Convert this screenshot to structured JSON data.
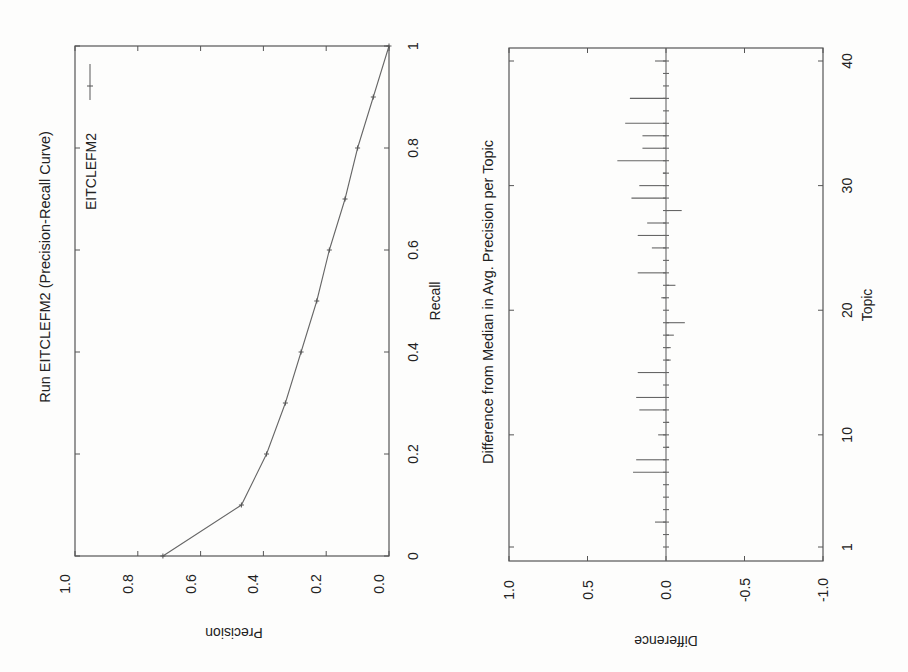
{
  "page": {
    "orientation": "rotated-90-ccw",
    "background": "#fdfdfc",
    "ink": "#555555"
  },
  "charts": {
    "pr": {
      "title": "Run EITCLEFM2 (Precision-Recall Curve)",
      "xlabel": "Recall",
      "ylabel": "Precision",
      "legend": "EITCLEFM2",
      "x_ticks": [
        "0",
        "0.2",
        "0.4",
        "0.6",
        "0.8",
        "1"
      ],
      "y_ticks": [
        "0.0",
        "0.2",
        "0.4",
        "0.6",
        "0.8",
        "1.0"
      ]
    },
    "diff": {
      "title": "Difference from Median in Avg. Precision per Topic",
      "xlabel": "Topic",
      "ylabel": "Difference",
      "x_ticks": [
        "1",
        "10",
        "20",
        "30",
        "40"
      ],
      "y_ticks": [
        "-1.0",
        "-0.5",
        "0.0",
        "0.5",
        "1.0"
      ]
    }
  },
  "chart_data": [
    {
      "type": "line",
      "title": "Run EITCLEFM2 (Precision-Recall Curve)",
      "xlabel": "Recall",
      "ylabel": "Precision",
      "xlim": [
        0,
        1
      ],
      "ylim": [
        0,
        1
      ],
      "grid": false,
      "legend_position": "upper right",
      "x": [
        0.0,
        0.1,
        0.2,
        0.3,
        0.4,
        0.5,
        0.6,
        0.7,
        0.8,
        0.9,
        1.0
      ],
      "series": [
        {
          "name": "EITCLEFM2",
          "values": [
            0.72,
            0.47,
            0.39,
            0.33,
            0.28,
            0.23,
            0.19,
            0.14,
            0.1,
            0.05,
            0.0
          ]
        }
      ],
      "x_ticks": [
        0,
        0.2,
        0.4,
        0.6,
        0.8,
        1
      ],
      "y_ticks": [
        0.0,
        0.2,
        0.4,
        0.6,
        0.8,
        1.0
      ]
    },
    {
      "type": "bar",
      "title": "Difference from Median in Avg. Precision per Topic",
      "xlabel": "Topic",
      "ylabel": "Difference",
      "xlim": [
        1,
        40
      ],
      "ylim": [
        -1.0,
        1.0
      ],
      "grid": false,
      "categories": [
        1,
        2,
        3,
        4,
        5,
        6,
        7,
        8,
        9,
        10,
        11,
        12,
        13,
        14,
        15,
        16,
        17,
        18,
        19,
        20,
        21,
        22,
        23,
        24,
        25,
        26,
        27,
        28,
        29,
        30,
        31,
        32,
        33,
        34,
        35,
        36,
        37,
        38,
        39,
        40
      ],
      "values": [
        0.01,
        0.01,
        0.07,
        0.01,
        0.01,
        0.01,
        0.21,
        0.19,
        -0.02,
        0.05,
        -0.02,
        0.17,
        0.19,
        0.01,
        0.18,
        -0.03,
        -0.03,
        -0.05,
        -0.12,
        0.01,
        0.03,
        -0.06,
        0.18,
        0.01,
        0.09,
        0.18,
        0.12,
        -0.1,
        0.22,
        0.17,
        0.02,
        0.31,
        0.15,
        0.15,
        0.26,
        -0.01,
        0.23,
        0.01,
        0.01,
        0.07
      ],
      "x_ticks": [
        1,
        10,
        20,
        30,
        40
      ],
      "y_ticks": [
        -1.0,
        -0.5,
        0.0,
        0.5,
        1.0
      ]
    }
  ]
}
